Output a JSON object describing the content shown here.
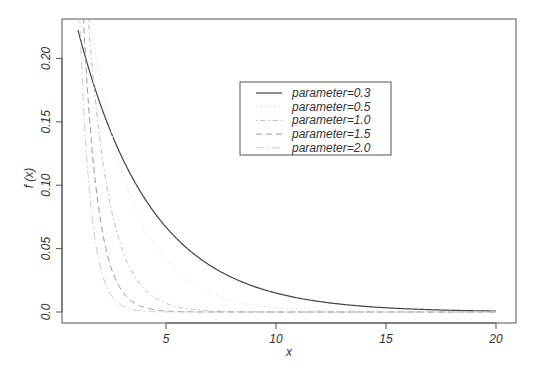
{
  "chart_data": {
    "type": "line",
    "title": "",
    "xlabel": "x",
    "ylabel": "f (x)",
    "xlim": [
      1,
      20
    ],
    "ylim": [
      0,
      0.22
    ],
    "x_ticks": [
      "5",
      "10",
      "15",
      "20"
    ],
    "x_tick_values": [
      5,
      10,
      15,
      20
    ],
    "y_ticks": [
      "0.0",
      "0.05",
      "0.10",
      "0.15",
      "0.20"
    ],
    "y_tick_values": [
      0,
      0.05,
      0.1,
      0.15,
      0.2
    ],
    "grid": false,
    "legend_position": "top-center-right",
    "function": "f(x) = parameter * exp(-parameter * x)",
    "series": [
      {
        "name": "parameter=0.3",
        "parameter": 0.3,
        "style": "solid",
        "color": "#444444",
        "width": 1.2,
        "sample_x": [
          1,
          2,
          5,
          10,
          15,
          20
        ],
        "sample_y": [
          0.222,
          0.165,
          0.067,
          0.015,
          0.0033,
          0.0007
        ]
      },
      {
        "name": "parameter=0.5",
        "parameter": 0.5,
        "style": "dotted",
        "color": "#dddddd",
        "width": 1,
        "sample_x": [
          1,
          2,
          5,
          10,
          15,
          20
        ],
        "sample_y": [
          0.303,
          0.184,
          0.041,
          0.0034,
          0.0003,
          0.0
        ]
      },
      {
        "name": "parameter=1.0",
        "parameter": 1.0,
        "style": "dotdash",
        "color": "#bbbbbb",
        "width": 1,
        "sample_x": [
          1,
          2,
          5,
          10,
          15,
          20
        ],
        "sample_y": [
          0.368,
          0.135,
          0.0067,
          5e-05,
          0.0,
          0.0
        ]
      },
      {
        "name": "parameter=1.5",
        "parameter": 1.5,
        "style": "dashed",
        "color": "#999999",
        "width": 1,
        "sample_x": [
          1,
          2,
          5,
          10,
          15,
          20
        ],
        "sample_y": [
          0.335,
          0.075,
          0.0008,
          0.0,
          0.0,
          0.0
        ]
      },
      {
        "name": "parameter=2.0",
        "parameter": 2.0,
        "style": "longdash-dot",
        "color": "#cccccc",
        "width": 1,
        "sample_x": [
          1,
          2,
          5,
          10,
          15,
          20
        ],
        "sample_y": [
          0.271,
          0.037,
          0.0001,
          0.0,
          0.0,
          0.0
        ]
      }
    ]
  },
  "legend": {
    "items": [
      {
        "label": "parameter=0.3"
      },
      {
        "label": "parameter=0.5"
      },
      {
        "label": "parameter=1.0"
      },
      {
        "label": "parameter=1.5"
      },
      {
        "label": "parameter=2.0"
      }
    ]
  }
}
